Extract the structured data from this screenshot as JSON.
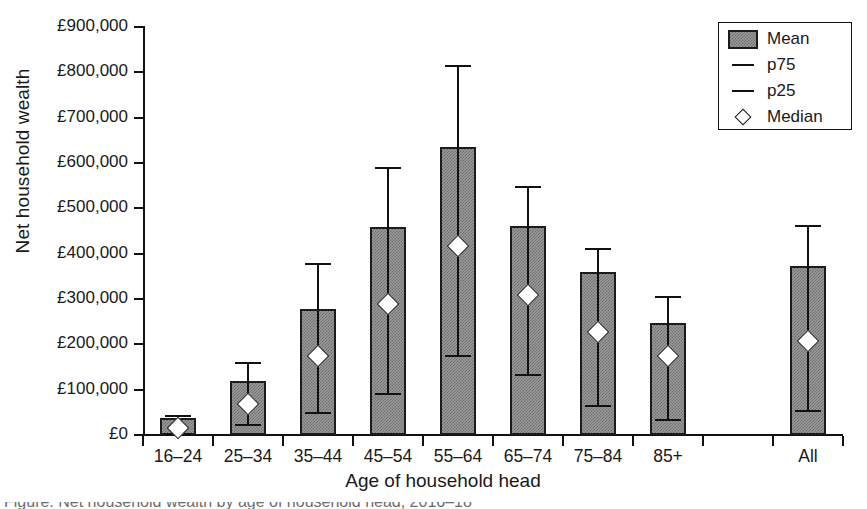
{
  "chart_data": {
    "type": "bar",
    "title": "",
    "xlabel": "Age of household head",
    "ylabel": "Net household wealth",
    "ylim": [
      0,
      900000
    ],
    "ytick_values": [
      0,
      100000,
      200000,
      300000,
      400000,
      500000,
      600000,
      700000,
      800000,
      900000
    ],
    "ytick_labels": [
      "£0",
      "£100,000",
      "£200,000",
      "£300,000",
      "£400,000",
      "£500,000",
      "£600,000",
      "£700,000",
      "£800,000",
      "£900,000"
    ],
    "grid": false,
    "legend_position": "top-right",
    "categories": [
      "16–24",
      "25–34",
      "35–44",
      "45–54",
      "55–64",
      "65–74",
      "75–84",
      "85+",
      "",
      "All"
    ],
    "series": [
      {
        "name": "Mean",
        "values": [
          37000,
          120000,
          278000,
          458000,
          635000,
          460000,
          360000,
          246000,
          null,
          373000
        ]
      },
      {
        "name": "p75",
        "values": [
          42000,
          158000,
          377000,
          590000,
          813000,
          548000,
          410000,
          305000,
          null,
          462000
        ]
      },
      {
        "name": "p25",
        "values": [
          2000,
          22000,
          48000,
          90000,
          175000,
          132000,
          65000,
          32000,
          null,
          53000
        ]
      },
      {
        "name": "Median",
        "values": [
          15000,
          68000,
          174000,
          290000,
          418000,
          308000,
          227000,
          174000,
          null,
          208000
        ]
      }
    ],
    "bars": [
      {
        "category": "16–24",
        "mean": 37000,
        "p25": 2000,
        "p75": 42000,
        "median": 15000
      },
      {
        "category": "25–34",
        "mean": 120000,
        "p25": 22000,
        "p75": 158000,
        "median": 68000
      },
      {
        "category": "35–44",
        "mean": 278000,
        "p25": 48000,
        "p75": 377000,
        "median": 174000
      },
      {
        "category": "45–54",
        "mean": 458000,
        "p25": 90000,
        "p75": 590000,
        "median": 290000
      },
      {
        "category": "55–64",
        "mean": 635000,
        "p25": 175000,
        "p75": 813000,
        "median": 418000
      },
      {
        "category": "65–74",
        "mean": 460000,
        "p25": 132000,
        "p75": 548000,
        "median": 308000
      },
      {
        "category": "75–84",
        "mean": 360000,
        "p25": 65000,
        "p75": 410000,
        "median": 227000
      },
      {
        "category": "85+",
        "mean": 246000,
        "p25": 32000,
        "p75": 305000,
        "median": 174000
      },
      {
        "category": "",
        "mean": null,
        "p25": null,
        "p75": null,
        "median": null
      },
      {
        "category": "All",
        "mean": 373000,
        "p25": 53000,
        "p75": 462000,
        "median": 208000
      }
    ]
  },
  "legend": {
    "entries": [
      {
        "label": "Mean",
        "key": "filled-square-swatch"
      },
      {
        "label": "p75",
        "key": "dash-marker"
      },
      {
        "label": "p25",
        "key": "dash-marker"
      },
      {
        "label": "Median",
        "key": "diamond-marker"
      }
    ]
  },
  "colors": {
    "bar_fill": "#9a9a9a",
    "bar_edge": "#1c1c1c",
    "axis": "#111111",
    "median_fill": "#ffffff",
    "background": "#ffffff"
  },
  "caption": {
    "cut_text": "Figure: Net household wealth by age of household head, 2016–18"
  }
}
